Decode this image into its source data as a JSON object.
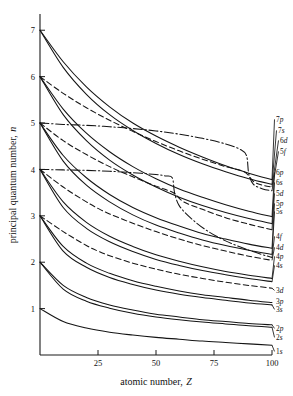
{
  "chart_data": {
    "type": "line",
    "title": "",
    "xlabel": "atomic number, Z",
    "ylabel": "principal quantum number, n",
    "xlim": [
      0,
      100
    ],
    "ylim": [
      0,
      7.35
    ],
    "xticks": [
      25,
      50,
      75,
      100
    ],
    "yticks": [
      1,
      2,
      3,
      4,
      5,
      6,
      7
    ],
    "grid": false,
    "legend_position": "right-inline-labels",
    "linestyles": {
      "s": "solid",
      "p": "solid",
      "d": "dashed",
      "f": "dash-dot"
    },
    "series": [
      {
        "name": "7p",
        "label": "7p",
        "style": "solid",
        "x": [
          0,
          10,
          20,
          30,
          40,
          50,
          60,
          70,
          80,
          90,
          100
        ],
        "y": [
          7.0,
          6.32,
          5.78,
          5.35,
          5.0,
          4.72,
          4.48,
          4.27,
          4.08,
          3.92,
          3.78
        ]
      },
      {
        "name": "7s",
        "label": "7s",
        "style": "solid",
        "x": [
          0,
          10,
          20,
          30,
          40,
          50,
          60,
          70,
          80,
          90,
          100
        ],
        "y": [
          7.0,
          6.2,
          5.62,
          5.18,
          4.84,
          4.56,
          4.32,
          4.12,
          3.95,
          3.8,
          3.68
        ]
      },
      {
        "name": "6d",
        "label": "6d",
        "style": "dashed",
        "x": [
          0,
          10,
          20,
          30,
          40,
          50,
          60,
          70,
          80,
          88,
          92,
          96,
          100
        ],
        "y": [
          6.0,
          5.64,
          5.33,
          5.06,
          4.82,
          4.6,
          4.4,
          4.22,
          4.06,
          3.95,
          3.74,
          3.66,
          3.62
        ]
      },
      {
        "name": "5f",
        "label": "5f",
        "style": "dash-dot",
        "x": [
          0,
          10,
          20,
          30,
          40,
          50,
          60,
          70,
          80,
          86,
          89,
          90,
          92,
          96,
          100
        ],
        "y": [
          5.0,
          4.97,
          4.95,
          4.92,
          4.88,
          4.83,
          4.76,
          4.67,
          4.55,
          4.44,
          4.3,
          3.9,
          3.68,
          3.58,
          3.54
        ]
      },
      {
        "name": "6p",
        "label": "6p",
        "style": "solid",
        "x": [
          0,
          10,
          20,
          30,
          40,
          50,
          60,
          70,
          80,
          90,
          100
        ],
        "y": [
          6.0,
          5.3,
          4.78,
          4.38,
          4.06,
          3.8,
          3.58,
          3.4,
          3.24,
          3.1,
          2.98
        ]
      },
      {
        "name": "6s",
        "label": "6s",
        "style": "solid",
        "x": [
          0,
          10,
          20,
          30,
          40,
          50,
          60,
          70,
          80,
          90,
          100
        ],
        "y": [
          6.0,
          5.18,
          4.62,
          4.2,
          3.88,
          3.62,
          3.4,
          3.22,
          3.07,
          2.94,
          2.83
        ]
      },
      {
        "name": "5d",
        "label": "5d",
        "style": "dashed",
        "x": [
          0,
          10,
          20,
          30,
          40,
          50,
          55,
          58,
          62,
          70,
          80,
          90,
          100
        ],
        "y": [
          5.0,
          4.62,
          4.32,
          4.06,
          3.84,
          3.64,
          3.55,
          3.48,
          3.3,
          3.14,
          2.96,
          2.82,
          2.7
        ]
      },
      {
        "name": "5p",
        "label": "5p",
        "style": "solid",
        "x": [
          0,
          10,
          20,
          30,
          40,
          50,
          60,
          70,
          80,
          90,
          100
        ],
        "y": [
          5.0,
          4.3,
          3.82,
          3.46,
          3.18,
          2.96,
          2.78,
          2.62,
          2.5,
          2.39,
          2.3
        ]
      },
      {
        "name": "5s",
        "label": "5s",
        "style": "solid",
        "x": [
          0,
          10,
          20,
          30,
          40,
          50,
          60,
          70,
          80,
          90,
          100
        ],
        "y": [
          5.0,
          4.18,
          3.66,
          3.3,
          3.02,
          2.8,
          2.63,
          2.48,
          2.36,
          2.26,
          2.17
        ]
      },
      {
        "name": "4f",
        "label": "4f",
        "style": "dash-dot",
        "x": [
          0,
          10,
          20,
          30,
          40,
          50,
          54,
          57,
          58,
          60,
          65,
          72,
          80,
          90,
          100
        ],
        "y": [
          4.0,
          3.99,
          3.98,
          3.96,
          3.93,
          3.89,
          3.86,
          3.82,
          3.5,
          3.22,
          2.95,
          2.68,
          2.46,
          2.26,
          2.1
        ]
      },
      {
        "name": "4d",
        "label": "4d",
        "style": "dashed",
        "x": [
          0,
          10,
          20,
          25,
          30,
          40,
          50,
          60,
          70,
          80,
          90,
          100
        ],
        "y": [
          4.0,
          3.62,
          3.3,
          3.16,
          3.04,
          2.84,
          2.66,
          2.5,
          2.36,
          2.24,
          2.13,
          2.04
        ]
      },
      {
        "name": "4p",
        "label": "4p",
        "style": "solid",
        "x": [
          0,
          10,
          20,
          30,
          40,
          50,
          60,
          70,
          80,
          90,
          100
        ],
        "y": [
          4.0,
          3.3,
          2.86,
          2.56,
          2.34,
          2.16,
          2.02,
          1.9,
          1.8,
          1.72,
          1.65
        ]
      },
      {
        "name": "4s",
        "label": "4s",
        "style": "solid",
        "x": [
          0,
          10,
          20,
          30,
          40,
          50,
          60,
          70,
          80,
          90,
          100
        ],
        "y": [
          4.0,
          3.18,
          2.73,
          2.44,
          2.23,
          2.06,
          1.93,
          1.82,
          1.73,
          1.65,
          1.58
        ]
      },
      {
        "name": "3d",
        "label": "3d",
        "style": "dashed",
        "x": [
          0,
          10,
          20,
          25,
          30,
          40,
          50,
          60,
          70,
          80,
          90,
          100
        ],
        "y": [
          3.0,
          2.66,
          2.36,
          2.24,
          2.14,
          1.98,
          1.85,
          1.74,
          1.65,
          1.57,
          1.5,
          1.44
        ]
      },
      {
        "name": "3p",
        "label": "3p",
        "style": "solid",
        "x": [
          0,
          10,
          20,
          30,
          40,
          50,
          60,
          70,
          80,
          90,
          100
        ],
        "y": [
          3.0,
          2.34,
          1.98,
          1.76,
          1.6,
          1.48,
          1.38,
          1.3,
          1.24,
          1.18,
          1.13
        ]
      },
      {
        "name": "3s",
        "label": "3s",
        "style": "solid",
        "x": [
          0,
          10,
          20,
          30,
          40,
          50,
          60,
          70,
          80,
          90,
          100
        ],
        "y": [
          3.0,
          2.24,
          1.89,
          1.67,
          1.52,
          1.4,
          1.31,
          1.24,
          1.18,
          1.12,
          1.08
        ]
      },
      {
        "name": "2p",
        "label": "2p",
        "style": "solid",
        "x": [
          0,
          10,
          20,
          30,
          40,
          50,
          60,
          70,
          80,
          90,
          100
        ],
        "y": [
          2.0,
          1.5,
          1.24,
          1.08,
          0.97,
          0.88,
          0.82,
          0.76,
          0.72,
          0.68,
          0.65
        ]
      },
      {
        "name": "2s",
        "label": "2s",
        "style": "solid",
        "x": [
          0,
          10,
          20,
          30,
          40,
          50,
          60,
          70,
          80,
          90,
          100
        ],
        "y": [
          2.0,
          1.42,
          1.16,
          1.01,
          0.9,
          0.82,
          0.76,
          0.71,
          0.67,
          0.63,
          0.6
        ]
      },
      {
        "name": "1s",
        "label": "1s",
        "style": "solid",
        "x": [
          0,
          10,
          20,
          30,
          40,
          50,
          60,
          70,
          80,
          90,
          100
        ],
        "y": [
          1.0,
          0.72,
          0.58,
          0.49,
          0.43,
          0.38,
          0.34,
          0.3,
          0.27,
          0.24,
          0.21
        ]
      }
    ]
  },
  "axes": {
    "y_title": "principal quantum number, n",
    "y_title_main": "principal quantum number, ",
    "y_title_italic": "n",
    "x_title_main": "atomic number, ",
    "x_title_italic": "Z",
    "xticklabels": [
      "25",
      "50",
      "75",
      "100"
    ],
    "yticklabels": [
      "1",
      "2",
      "3",
      "4",
      "5",
      "6",
      "7"
    ]
  },
  "labels": {
    "l_7p": "7p",
    "l_7s": "7s",
    "l_6d": "6d",
    "l_5f": "5f",
    "l_6p": "6p",
    "l_6s": "6s",
    "l_5d": "5d",
    "l_5p": "5p",
    "l_5s": "5s",
    "l_4f": "4f",
    "l_4d": "4d",
    "l_4p": "4p",
    "l_4s": "4s",
    "l_3d": "3d",
    "l_3p": "3p",
    "l_3s": "3s",
    "l_2p": "2p",
    "l_2s": "2s",
    "l_1s": "1s"
  },
  "colors": {
    "ink": "#141414",
    "background": "#ffffff"
  }
}
